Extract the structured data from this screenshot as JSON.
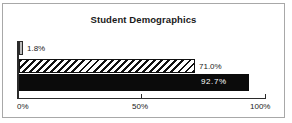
{
  "chart_data": {
    "type": "bar",
    "orientation": "horizontal",
    "title": "Student Demographics",
    "xlabel": "",
    "ylabel": "",
    "xlim": [
      0,
      100
    ],
    "grid": false,
    "legend": false,
    "xticks": [
      {
        "value": 0,
        "label": "0%"
      },
      {
        "value": 50,
        "label": "50%"
      },
      {
        "value": 100,
        "label": "100%"
      }
    ],
    "categories": [
      "",
      "",
      ""
    ],
    "values": [
      1.8,
      71.0,
      92.7
    ],
    "bars": [
      {
        "value": 1.8,
        "data_label": "1.8%",
        "fill_style": "style-grey",
        "label_position": "outside",
        "fill_color": "#bdbdbd",
        "edge_color": "#2b2b2b"
      },
      {
        "value": 71.0,
        "data_label": "71.0%",
        "fill_style": "style-hatch",
        "label_position": "outside",
        "fill_color": "#ffffff",
        "edge_color": "#111111"
      },
      {
        "value": 92.7,
        "data_label": "92.7%",
        "fill_style": "style-solid-black",
        "label_position": "inside",
        "fill_color": "#0b0b0b",
        "edge_color": "#0b0b0b"
      }
    ]
  },
  "frame": {
    "border_color": "#a8a8a8",
    "background": "#ffffff"
  }
}
